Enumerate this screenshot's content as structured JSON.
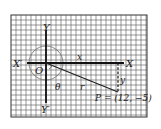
{
  "figure": {
    "axis_labels": {
      "x_pos": "X",
      "x_neg": "X′",
      "y_pos": "Y",
      "y_neg": "Y′",
      "origin": "O"
    },
    "segment_labels": {
      "x": "x",
      "y": "y",
      "r": "r",
      "angle": "θ"
    },
    "point_label": "P = (12, −5)",
    "colors": {
      "grid": "#555555",
      "axis": "#111111",
      "circle": "#777777",
      "background": "#ffffff"
    }
  }
}
